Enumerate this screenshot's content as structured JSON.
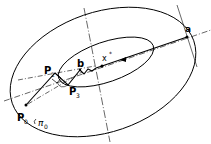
{
  "diagram": {
    "labels": {
      "a": "a",
      "b": "b",
      "x_star": "x",
      "x_star_sup": "*",
      "p0": "P",
      "p0_sub": "0",
      "p2": "P",
      "p2_sub": "2",
      "p3": "P",
      "p3_sub": "3",
      "pi0": "π",
      "pi0_sub": "0"
    },
    "colors": {
      "stroke": "#000000",
      "background": "#ffffff"
    }
  }
}
